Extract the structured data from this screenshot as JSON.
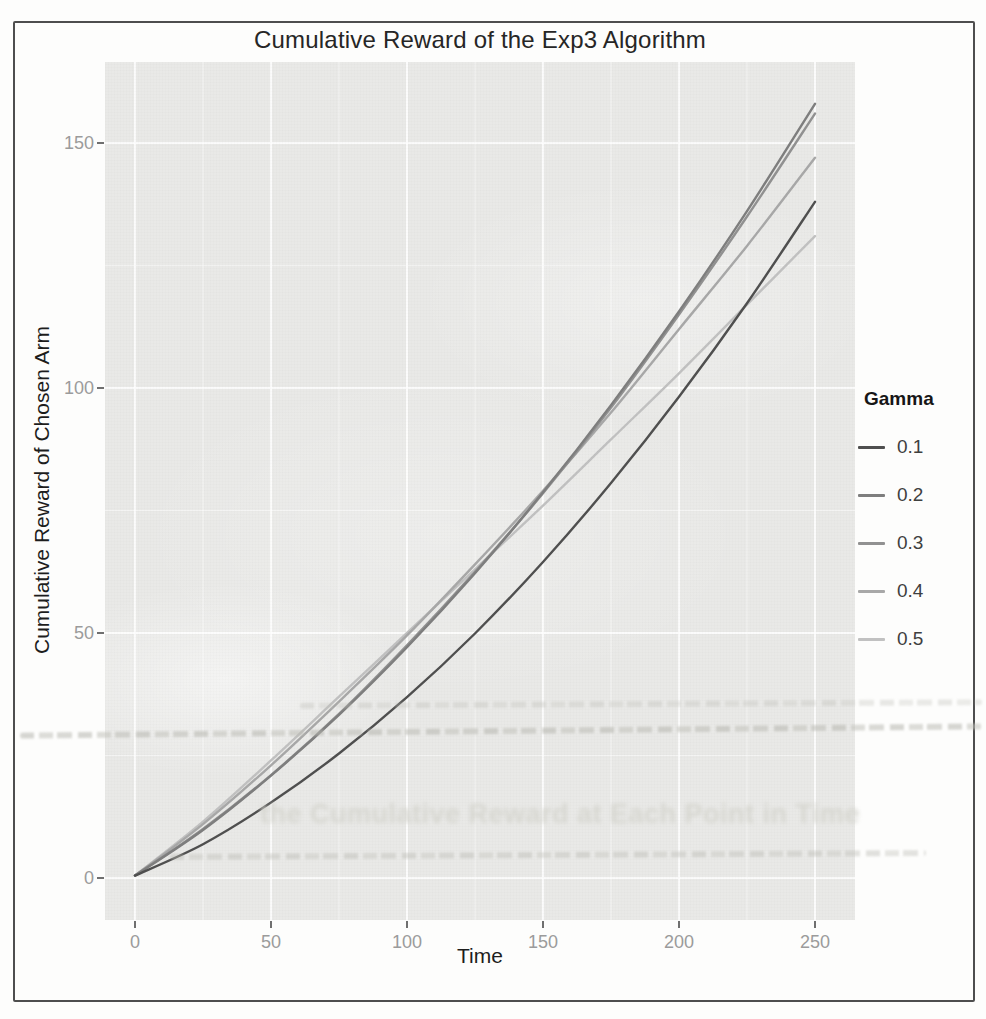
{
  "chart_data": {
    "type": "line",
    "title": "Cumulative Reward of the Exp3 Algorithm",
    "xlabel": "Time",
    "ylabel": "Cumulative Reward of Chosen Arm",
    "legend_title": "Gamma",
    "legend_position": "right",
    "grid": true,
    "x_ticks": [
      0,
      50,
      100,
      150,
      200,
      250
    ],
    "y_ticks": [
      0,
      50,
      100,
      150
    ],
    "xlim": [
      0,
      250
    ],
    "ylim": [
      0,
      160
    ],
    "x": [
      0,
      25,
      50,
      75,
      100,
      125,
      150,
      175,
      200,
      225,
      250
    ],
    "series": [
      {
        "name": "0.1",
        "color": "#4f4f4f",
        "values": [
          0.5,
          6.9,
          15.4,
          25.4,
          36.9,
          49.9,
          64.5,
          80.6,
          98.2,
          117.3,
          138
        ]
      },
      {
        "name": "0.2",
        "color": "#7e7e7e",
        "values": [
          0.5,
          9.8,
          20.9,
          33.3,
          47.1,
          62.2,
          78.7,
          96.5,
          115.6,
          136.1,
          158
        ]
      },
      {
        "name": "0.3",
        "color": "#919191",
        "values": [
          0.5,
          10.0,
          21.0,
          33.5,
          47.5,
          62.5,
          78.5,
          96.0,
          115.0,
          135.0,
          156
        ]
      },
      {
        "name": "0.4",
        "color": "#a8a8a8",
        "values": [
          0.5,
          11.0,
          23.0,
          36.0,
          49.5,
          64.0,
          79.0,
          95.0,
          112.0,
          129.0,
          147
        ]
      },
      {
        "name": "0.5",
        "color": "#c1c1c1",
        "values": [
          0.5,
          11.5,
          24.0,
          37.0,
          50.0,
          63.0,
          76.0,
          89.5,
          103.0,
          117.0,
          131
        ]
      }
    ]
  },
  "bleedthrough": {
    "heading": "the Cumulative Reward at Each Point in Time"
  }
}
